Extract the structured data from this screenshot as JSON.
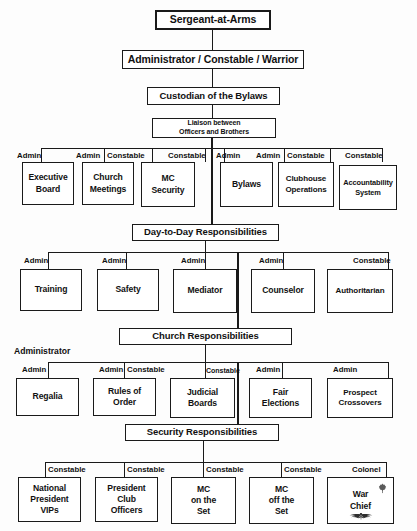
{
  "chart": {
    "top": {
      "level1": "Sergeant-at-Arms",
      "level2": "Administrator / Constable / Warrior",
      "level3": "Custodian of the Bylaws",
      "level4_line1": "Liaison between",
      "level4_line2": "Officers and Brothers"
    },
    "sections": [
      {
        "header": null,
        "side_label": null,
        "nodes": [
          {
            "role": "Admin",
            "line1": "Executive",
            "line2": "Board"
          },
          {
            "role": "Admin",
            "line1": "Church",
            "line2": "Meetings"
          },
          {
            "role": "Constable",
            "line1": "MC",
            "line2": "Security"
          },
          {
            "role": "Constable",
            "line1": null,
            "line2": null
          },
          {
            "role": "Admin",
            "line1": "Bylaws",
            "line2": null
          },
          {
            "role": "Admin",
            "line1": "Clubhouse",
            "line2": "Operations"
          },
          {
            "role": "Constable",
            "line1": "Accountability",
            "line2": "System"
          },
          {
            "role": "Constable",
            "line1": null,
            "line2": null
          }
        ]
      },
      {
        "header": "Day-to-Day Responsibilities",
        "side_label": null,
        "nodes": [
          {
            "role": "Admin",
            "line1": "Training",
            "line2": null
          },
          {
            "role": "Admin",
            "line1": "Safety",
            "line2": null
          },
          {
            "role": "Admin",
            "line1": "Mediator",
            "line2": null
          },
          {
            "role": "Admin",
            "line1": "Counselor",
            "line2": null
          },
          {
            "role": "Constable",
            "line1": "Authoritarian",
            "line2": null
          }
        ]
      },
      {
        "header": "Church Responsibilities",
        "side_label": "Administrator",
        "nodes": [
          {
            "role": "Admin",
            "line1": "Regalia",
            "line2": null
          },
          {
            "role": "Admin",
            "line1": "Rules of",
            "line2": "Order"
          },
          {
            "role": "Constable",
            "line1": "Judicial",
            "line2": "Boards"
          },
          {
            "role": "Constable",
            "line1": null,
            "line2": null
          },
          {
            "role": "Admin",
            "line1": "Fair",
            "line2": "Elections"
          },
          {
            "role": "Admin",
            "line1": "Prospect",
            "line2": "Crossovers"
          }
        ]
      },
      {
        "header": "Security Responsibilities",
        "side_label": null,
        "nodes": [
          {
            "role": "Constable",
            "line1": "National",
            "line2": "President",
            "line3": "VIPs"
          },
          {
            "role": "Constable",
            "line1": "President",
            "line2": "Club",
            "line3": "Officers"
          },
          {
            "role": "Constable",
            "line1": "MC",
            "line2": "on the",
            "line3": "Set"
          },
          {
            "role": "Constable",
            "line1": "MC",
            "line2": "off the",
            "line3": "Set"
          },
          {
            "role": "Colonel",
            "line1": "War",
            "line2": "Chief",
            "line3": null
          }
        ]
      }
    ],
    "colors": {
      "ink": "#1a1a1a",
      "paper": "#fdfdfd",
      "box_fill": "#ffffff"
    }
  }
}
